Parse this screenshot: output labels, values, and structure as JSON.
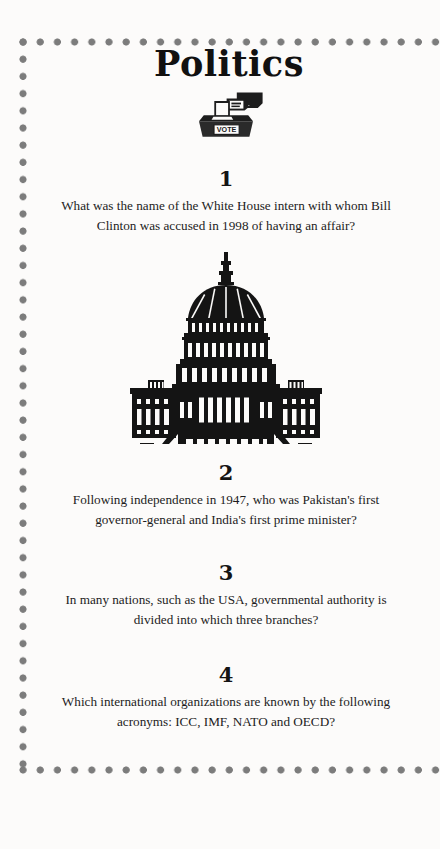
{
  "page": {
    "title": "Politics",
    "background_color": "#fcfbfa",
    "border": {
      "style": "dotted",
      "dot_color": "#7c7c7c"
    }
  },
  "header": {
    "title": "Politics",
    "icon": {
      "name": "ballot-box-vote-icon",
      "label": "VOTE"
    }
  },
  "illustration": {
    "name": "us-capitol-building-illustration",
    "alt": "United States Capitol building"
  },
  "questions": [
    {
      "number": "1",
      "text": "What was the name of the White House intern with whom Bill Clinton was accused in 1998 of having an affair?"
    },
    {
      "number": "2",
      "text": "Following independence in 1947, who was Pakistan's first governor-general and India's first prime minister?"
    },
    {
      "number": "3",
      "text": "In many nations, such as the USA, governmental authority is divided into which three branches?"
    },
    {
      "number": "4",
      "text": "Which international organizations are known by the following acronyms: ICC, IMF, NATO and OECD?"
    }
  ]
}
